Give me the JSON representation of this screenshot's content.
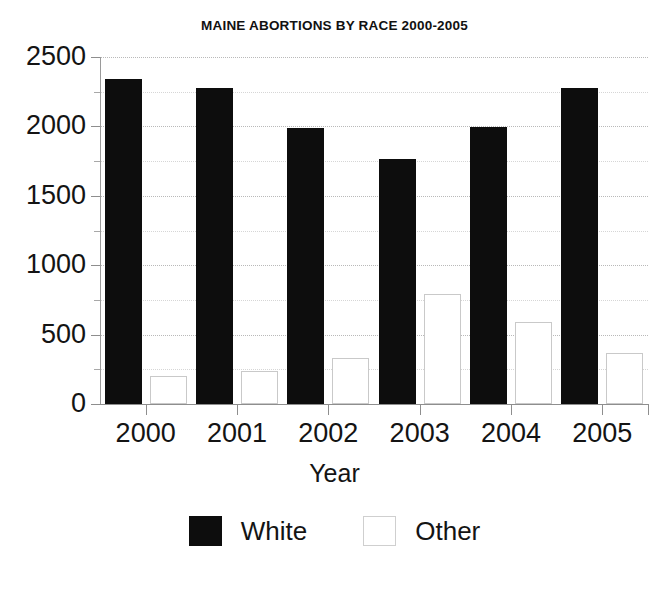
{
  "chart_data": {
    "type": "bar",
    "title": "MAINE ABORTIONS BY RACE 2000-2005",
    "xlabel": "Year",
    "ylabel": "",
    "categories": [
      "2000",
      "2001",
      "2002",
      "2003",
      "2004",
      "2005"
    ],
    "series": [
      {
        "name": "White",
        "color": "#0d0d0d",
        "values": [
          2340,
          2280,
          1990,
          1765,
          1995,
          2280
        ]
      },
      {
        "name": "Other",
        "color": "#ffffff",
        "values": [
          200,
          235,
          335,
          790,
          590,
          370
        ]
      }
    ],
    "ylim": [
      0,
      2500
    ],
    "ytick_labels": [
      "0",
      "500",
      "1000",
      "1500",
      "2000",
      "2500"
    ],
    "ytick_values": [
      0,
      500,
      1000,
      1500,
      2000,
      2500
    ],
    "yminor_values": [
      250,
      750,
      1250,
      1750,
      2250
    ],
    "grid": true,
    "legend_position": "bottom",
    "legend": [
      "White",
      "Other"
    ]
  },
  "axes": {
    "y_axis_name": "abortions-count-axis",
    "x_axis_name": "year-axis"
  }
}
